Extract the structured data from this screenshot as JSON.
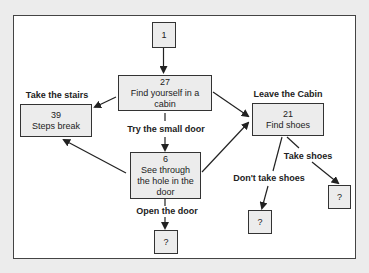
{
  "diagram": {
    "type": "flowchart",
    "colors": {
      "background": "#ececec",
      "frame_fill": "#ffffff",
      "frame_border": "#444444",
      "node_fill": "#ececec",
      "node_border": "#333333",
      "text": "#222222"
    },
    "nodes": [
      {
        "id": "n1",
        "number": "1",
        "text": ""
      },
      {
        "id": "n27",
        "number": "27",
        "text": "Find yourself in a cabin"
      },
      {
        "id": "n39",
        "number": "39",
        "text": "Steps break"
      },
      {
        "id": "n21",
        "number": "21",
        "text": "Find shoes"
      },
      {
        "id": "n6",
        "number": "6",
        "text": "See through the hole in the door"
      },
      {
        "id": "q_open",
        "number": "?",
        "text": ""
      },
      {
        "id": "q_notake",
        "number": "?",
        "text": ""
      },
      {
        "id": "q_take",
        "number": "?",
        "text": ""
      }
    ],
    "edges": [
      {
        "from": "n1",
        "to": "n27",
        "label": ""
      },
      {
        "from": "n27",
        "to": "n39",
        "label": "Take the stairs"
      },
      {
        "from": "n27",
        "to": "n21",
        "label": "Leave the Cabin"
      },
      {
        "from": "n27",
        "to": "n6",
        "label": "Try the small door"
      },
      {
        "from": "n6",
        "to": "n39",
        "label": ""
      },
      {
        "from": "n6",
        "to": "n21",
        "label": ""
      },
      {
        "from": "n6",
        "to": "q_open",
        "label": "Open the door"
      },
      {
        "from": "n21",
        "to": "q_notake",
        "label": "Don't take shoes"
      },
      {
        "from": "n21",
        "to": "q_take",
        "label": "Take shoes"
      }
    ],
    "labels": {
      "take_stairs": "Take the stairs",
      "leave_cabin": "Leave the Cabin",
      "small_door": "Try the small door",
      "open_door": "Open the door",
      "dont_take_shoes": "Don't take shoes",
      "take_shoes": "Take shoes"
    }
  }
}
